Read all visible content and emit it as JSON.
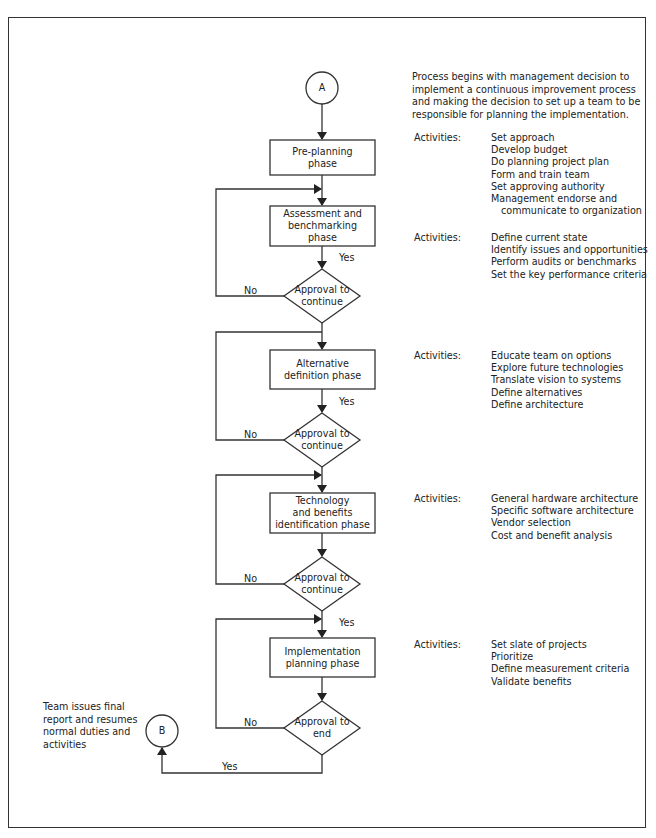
{
  "connectors": {
    "start": "A",
    "end": "B"
  },
  "intro_note": "Process begins with management decision to implement a continuous improvement process and making the decision to set up a team to be responsible for planning the implementation.",
  "intro_lines": [
    "Process begins with management decision to",
    "implement a continuous improvement process",
    "and making the decision to set up a team to be",
    "responsible for planning the implementation."
  ],
  "end_note_lines": [
    "Team issues final",
    "report and resumes",
    "normal duties and",
    "activities"
  ],
  "phases": [
    {
      "label_lines": [
        "Pre-planning",
        "phase"
      ],
      "activities_label": "Activities:",
      "activities": [
        "Set approach",
        "Develop budget",
        "Do planning project plan",
        "Form and train team",
        "Set approving authority",
        "Management endorse and",
        "communicate to organization"
      ]
    },
    {
      "label_lines": [
        "Assessment and",
        "benchmarking",
        "phase"
      ],
      "activities_label": "Activities:",
      "activities": [
        "Define current state",
        "Identify issues and opportunities",
        "Perform audits or benchmarks",
        "Set the key performance criteria"
      ]
    },
    {
      "label_lines": [
        "Alternative",
        "definition phase"
      ],
      "activities_label": "Activities:",
      "activities": [
        "Educate team on options",
        "Explore future technologies",
        "Translate vision to systems",
        "Define alternatives",
        "Define architecture"
      ]
    },
    {
      "label_lines": [
        "Technology",
        "and benefits",
        "identification phase"
      ],
      "activities_label": "Activities:",
      "activities": [
        "General hardware architecture",
        "Specific software architecture",
        "Vendor selection",
        "Cost and benefit analysis"
      ]
    },
    {
      "label_lines": [
        "Implementation",
        "planning phase"
      ],
      "activities_label": "Activities:",
      "activities": [
        "Set slate of projects",
        "Prioritize",
        "Define measurement criteria",
        "Validate benefits"
      ]
    }
  ],
  "decisions": [
    {
      "label_lines": [
        "Approval to",
        "continue"
      ],
      "yes": "Yes",
      "no": "No"
    },
    {
      "label_lines": [
        "Approval to",
        "continue"
      ],
      "yes": "Yes",
      "no": "No"
    },
    {
      "label_lines": [
        "Approval to",
        "continue"
      ],
      "yes": "Yes",
      "no": "No"
    },
    {
      "label_lines": [
        "Approval to",
        "end"
      ],
      "yes": "Yes",
      "no": "No"
    }
  ]
}
